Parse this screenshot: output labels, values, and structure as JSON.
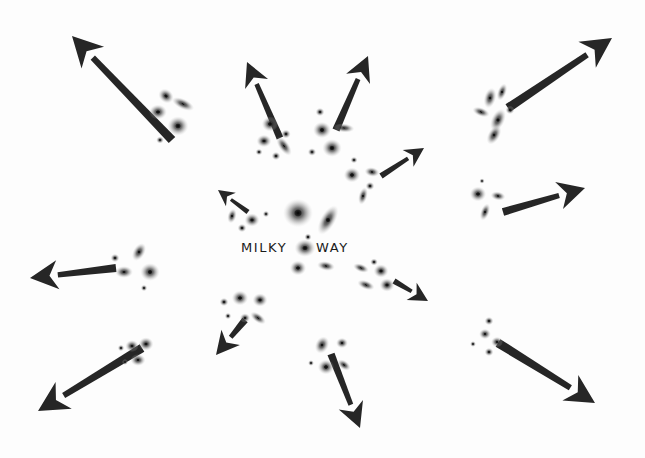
{
  "diagram": {
    "background_color": "#fdfdfd",
    "ink_color": "#262626",
    "center_label": {
      "word_left": "MILKY",
      "word_right": "WAY"
    },
    "width": 645,
    "height": 458
  },
  "arrows": [
    {
      "name": "arrow-up-left-outer",
      "x1": 172,
      "y1": 140,
      "x2": 72,
      "y2": 36,
      "width": 9,
      "head": 30
    },
    {
      "name": "arrow-up-center-left",
      "x1": 280,
      "y1": 138,
      "x2": 247,
      "y2": 62,
      "width": 7,
      "head": 24
    },
    {
      "name": "arrow-up-center-right",
      "x1": 336,
      "y1": 130,
      "x2": 368,
      "y2": 56,
      "width": 7.5,
      "head": 25
    },
    {
      "name": "arrow-up-right-outer",
      "x1": 508,
      "y1": 108,
      "x2": 612,
      "y2": 38,
      "width": 9,
      "head": 30
    },
    {
      "name": "arrow-up-right-inner",
      "x1": 381,
      "y1": 176,
      "x2": 424,
      "y2": 148,
      "width": 6,
      "head": 19
    },
    {
      "name": "arrow-right-middle",
      "x1": 503,
      "y1": 212,
      "x2": 585,
      "y2": 188,
      "width": 8,
      "head": 27
    },
    {
      "name": "arrow-right-lower-inner",
      "x1": 394,
      "y1": 281,
      "x2": 428,
      "y2": 301,
      "width": 6,
      "head": 19
    },
    {
      "name": "arrow-down-right-outer",
      "x1": 498,
      "y1": 343,
      "x2": 595,
      "y2": 403,
      "width": 9,
      "head": 29
    },
    {
      "name": "arrow-down-center-right",
      "x1": 331,
      "y1": 354,
      "x2": 360,
      "y2": 428,
      "width": 7.5,
      "head": 25
    },
    {
      "name": "arrow-down-center-left",
      "x1": 245,
      "y1": 320,
      "x2": 216,
      "y2": 355,
      "width": 7,
      "head": 23
    },
    {
      "name": "arrow-down-left-outer",
      "x1": 142,
      "y1": 348,
      "x2": 38,
      "y2": 411,
      "width": 9,
      "head": 30
    },
    {
      "name": "arrow-left-middle",
      "x1": 116,
      "y1": 268,
      "x2": 30,
      "y2": 278,
      "width": 8,
      "head": 28
    },
    {
      "name": "arrow-center-up-left",
      "x1": 248,
      "y1": 212,
      "x2": 218,
      "y2": 190,
      "width": 5,
      "head": 16
    }
  ],
  "galaxy_clusters": [
    {
      "name": "cluster-up-left",
      "galaxies": [
        {
          "cx": 166,
          "cy": 96,
          "rx": 5.5,
          "ry": 4.5,
          "rot": 40,
          "core": 2.2
        },
        {
          "cx": 183,
          "cy": 104,
          "rx": 8,
          "ry": 3.5,
          "rot": 25,
          "core": 1.8
        },
        {
          "cx": 158,
          "cy": 112,
          "rx": 6,
          "ry": 5,
          "rot": 0,
          "core": 2.4
        },
        {
          "cx": 178,
          "cy": 126,
          "rx": 7,
          "ry": 6.5,
          "rot": 0,
          "core": 3.0
        },
        {
          "cx": 160,
          "cy": 140,
          "rx": 2.6,
          "ry": 2.4,
          "rot": 0,
          "core": 1.2
        }
      ]
    },
    {
      "name": "cluster-up-center-left",
      "galaxies": [
        {
          "cx": 270,
          "cy": 124,
          "rx": 5.5,
          "ry": 5,
          "rot": 0,
          "core": 2.4
        },
        {
          "cx": 286,
          "cy": 134,
          "rx": 3.2,
          "ry": 3,
          "rot": 0,
          "core": 1.4
        },
        {
          "cx": 264,
          "cy": 141,
          "rx": 5,
          "ry": 4.2,
          "rot": 0,
          "core": 2.1
        },
        {
          "cx": 284,
          "cy": 146,
          "rx": 7.5,
          "ry": 3.5,
          "rot": 55,
          "core": 1.8
        },
        {
          "cx": 259,
          "cy": 152,
          "rx": 2.4,
          "ry": 2.2,
          "rot": 0,
          "core": 1.1
        },
        {
          "cx": 276,
          "cy": 156,
          "rx": 3,
          "ry": 2.8,
          "rot": 0,
          "core": 1.3
        }
      ]
    },
    {
      "name": "cluster-up-center-right",
      "galaxies": [
        {
          "cx": 320,
          "cy": 112,
          "rx": 3,
          "ry": 2.8,
          "rot": 0,
          "core": 1.3
        },
        {
          "cx": 322,
          "cy": 130,
          "rx": 6,
          "ry": 5.5,
          "rot": 0,
          "core": 2.6
        },
        {
          "cx": 344,
          "cy": 128,
          "rx": 7,
          "ry": 3,
          "rot": 5,
          "core": 1.6
        },
        {
          "cx": 332,
          "cy": 148,
          "rx": 6.5,
          "ry": 6,
          "rot": 0,
          "core": 2.8
        },
        {
          "cx": 312,
          "cy": 152,
          "rx": 2.8,
          "ry": 2.6,
          "rot": 0,
          "core": 1.2
        }
      ]
    },
    {
      "name": "cluster-up-right",
      "galaxies": [
        {
          "cx": 490,
          "cy": 98,
          "rx": 4,
          "ry": 7,
          "rot": 15,
          "core": 1.8
        },
        {
          "cx": 502,
          "cy": 92,
          "rx": 3,
          "ry": 6,
          "rot": 20,
          "core": 1.5
        },
        {
          "cx": 481,
          "cy": 112,
          "rx": 6,
          "ry": 3,
          "rot": 20,
          "core": 1.6
        },
        {
          "cx": 498,
          "cy": 120,
          "rx": 4.5,
          "ry": 8,
          "rot": 25,
          "core": 2.0
        },
        {
          "cx": 510,
          "cy": 110,
          "rx": 3,
          "ry": 2.8,
          "rot": 0,
          "core": 1.3
        },
        {
          "cx": 494,
          "cy": 135,
          "rx": 4,
          "ry": 7,
          "rot": 30,
          "core": 1.8
        }
      ]
    },
    {
      "name": "cluster-up-right-inner",
      "galaxies": [
        {
          "cx": 354,
          "cy": 160,
          "rx": 2.4,
          "ry": 2.2,
          "rot": 0,
          "core": 1.1
        },
        {
          "cx": 352,
          "cy": 175,
          "rx": 5.5,
          "ry": 5,
          "rot": 0,
          "core": 2.4
        },
        {
          "cx": 372,
          "cy": 172,
          "rx": 5,
          "ry": 3.2,
          "rot": 10,
          "core": 1.6
        },
        {
          "cx": 370,
          "cy": 186,
          "rx": 3,
          "ry": 2.8,
          "rot": 0,
          "core": 1.3
        },
        {
          "cx": 363,
          "cy": 196,
          "rx": 3,
          "ry": 6,
          "rot": 15,
          "core": 1.5
        }
      ]
    },
    {
      "name": "cluster-right-middle",
      "galaxies": [
        {
          "cx": 482,
          "cy": 181,
          "rx": 1.8,
          "ry": 1.8,
          "rot": 0,
          "core": 0.9
        },
        {
          "cx": 478,
          "cy": 194,
          "rx": 5.5,
          "ry": 5,
          "rot": 0,
          "core": 2.3
        },
        {
          "cx": 498,
          "cy": 196,
          "rx": 5,
          "ry": 3,
          "rot": 10,
          "core": 1.5
        },
        {
          "cx": 485,
          "cy": 212,
          "rx": 3,
          "ry": 6,
          "rot": 20,
          "core": 1.5
        }
      ]
    },
    {
      "name": "cluster-right-lower",
      "galaxies": [
        {
          "cx": 374,
          "cy": 262,
          "rx": 2.6,
          "ry": 2.4,
          "rot": 0,
          "core": 1.2
        },
        {
          "cx": 361,
          "cy": 268,
          "rx": 5.5,
          "ry": 2.8,
          "rot": 20,
          "core": 1.4
        },
        {
          "cx": 381,
          "cy": 271,
          "rx": 5,
          "ry": 4.5,
          "rot": 0,
          "core": 2.1
        },
        {
          "cx": 366,
          "cy": 285,
          "rx": 6,
          "ry": 3,
          "rot": 20,
          "core": 1.5
        },
        {
          "cx": 387,
          "cy": 285,
          "rx": 5,
          "ry": 4.5,
          "rot": 0,
          "core": 2.1
        }
      ]
    },
    {
      "name": "cluster-down-right",
      "galaxies": [
        {
          "cx": 489,
          "cy": 321,
          "rx": 3,
          "ry": 2.8,
          "rot": 0,
          "core": 1.3
        },
        {
          "cx": 485,
          "cy": 334,
          "rx": 4,
          "ry": 3.5,
          "rot": 0,
          "core": 1.6
        },
        {
          "cx": 497,
          "cy": 342,
          "rx": 4,
          "ry": 3.5,
          "rot": 0,
          "core": 1.6
        },
        {
          "cx": 489,
          "cy": 352,
          "rx": 3,
          "ry": 2.8,
          "rot": 0,
          "core": 1.3
        },
        {
          "cx": 473,
          "cy": 344,
          "rx": 2,
          "ry": 2,
          "rot": 0,
          "core": 1.0
        }
      ]
    },
    {
      "name": "cluster-down-center-right",
      "galaxies": [
        {
          "cx": 322,
          "cy": 345,
          "rx": 4.5,
          "ry": 6,
          "rot": 25,
          "core": 1.8
        },
        {
          "cx": 342,
          "cy": 343,
          "rx": 4,
          "ry": 3.5,
          "rot": 0,
          "core": 1.7
        },
        {
          "cx": 311,
          "cy": 363,
          "rx": 2,
          "ry": 2,
          "rot": 0,
          "core": 1.0
        },
        {
          "cx": 326,
          "cy": 367,
          "rx": 5.5,
          "ry": 5,
          "rot": 0,
          "core": 2.4
        },
        {
          "cx": 344,
          "cy": 365,
          "rx": 5,
          "ry": 3,
          "rot": 35,
          "core": 1.5
        }
      ]
    },
    {
      "name": "cluster-down-center-left",
      "galaxies": [
        {
          "cx": 224,
          "cy": 302,
          "rx": 3,
          "ry": 2.8,
          "rot": 0,
          "core": 1.3
        },
        {
          "cx": 240,
          "cy": 298,
          "rx": 5.5,
          "ry": 5,
          "rot": 0,
          "core": 2.3
        },
        {
          "cx": 260,
          "cy": 300,
          "rx": 5,
          "ry": 4.5,
          "rot": 0,
          "core": 2.1
        },
        {
          "cx": 228,
          "cy": 316,
          "rx": 2.2,
          "ry": 2.2,
          "rot": 0,
          "core": 1.1
        },
        {
          "cx": 245,
          "cy": 318,
          "rx": 3.5,
          "ry": 3.2,
          "rot": 0,
          "core": 1.5
        },
        {
          "cx": 258,
          "cy": 318,
          "rx": 6,
          "ry": 3,
          "rot": 35,
          "core": 1.5
        }
      ]
    },
    {
      "name": "cluster-down-left",
      "galaxies": [
        {
          "cx": 121,
          "cy": 348,
          "rx": 2.2,
          "ry": 2.2,
          "rot": 0,
          "core": 1.1
        },
        {
          "cx": 132,
          "cy": 346,
          "rx": 4.5,
          "ry": 4,
          "rot": 0,
          "core": 1.9
        },
        {
          "cx": 146,
          "cy": 344,
          "rx": 5,
          "ry": 4.5,
          "rot": 0,
          "core": 2.0
        },
        {
          "cx": 138,
          "cy": 360,
          "rx": 5,
          "ry": 4,
          "rot": 0,
          "core": 1.8
        },
        {
          "cx": 125,
          "cy": 362,
          "rx": 2,
          "ry": 2,
          "rot": 0,
          "core": 1.0
        }
      ]
    },
    {
      "name": "cluster-left-middle",
      "galaxies": [
        {
          "cx": 115,
          "cy": 258,
          "rx": 3,
          "ry": 2.8,
          "rot": 0,
          "core": 1.3
        },
        {
          "cx": 139,
          "cy": 252,
          "rx": 4,
          "ry": 6.5,
          "rot": 30,
          "core": 1.8
        },
        {
          "cx": 124,
          "cy": 272,
          "rx": 6,
          "ry": 4,
          "rot": 0,
          "core": 2.0
        },
        {
          "cx": 150,
          "cy": 272,
          "rx": 6.5,
          "ry": 6,
          "rot": 0,
          "core": 2.6
        },
        {
          "cx": 144,
          "cy": 288,
          "rx": 2.2,
          "ry": 2.2,
          "rot": 0,
          "core": 1.1
        }
      ]
    },
    {
      "name": "cluster-center-milky-way",
      "galaxies": [
        {
          "cx": 232,
          "cy": 216,
          "rx": 3,
          "ry": 5,
          "rot": 15,
          "core": 1.5
        },
        {
          "cx": 242,
          "cy": 228,
          "rx": 3,
          "ry": 2.8,
          "rot": 0,
          "core": 1.3
        },
        {
          "cx": 252,
          "cy": 220,
          "rx": 5,
          "ry": 4.5,
          "rot": 0,
          "core": 2.1
        },
        {
          "cx": 266,
          "cy": 214,
          "rx": 2.2,
          "ry": 2.2,
          "rot": 0,
          "core": 1.0
        },
        {
          "cx": 298,
          "cy": 213,
          "rx": 10,
          "ry": 9.5,
          "rot": 0,
          "core": 4.2
        },
        {
          "cx": 328,
          "cy": 220,
          "rx": 5,
          "ry": 11,
          "rot": 30,
          "core": 2.6
        },
        {
          "cx": 308,
          "cy": 237,
          "rx": 2.4,
          "ry": 2.4,
          "rot": 0,
          "core": 1.2
        },
        {
          "cx": 305,
          "cy": 248,
          "rx": 7,
          "ry": 6,
          "rot": 0,
          "core": 3.0
        },
        {
          "cx": 298,
          "cy": 268,
          "rx": 5.5,
          "ry": 5,
          "rot": 0,
          "core": 2.3
        },
        {
          "cx": 326,
          "cy": 266,
          "rx": 6,
          "ry": 3.2,
          "rot": 10,
          "core": 1.6
        }
      ]
    }
  ]
}
